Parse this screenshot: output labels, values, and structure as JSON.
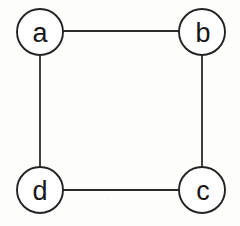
{
  "diagram": {
    "kind": "undirected-graph",
    "title": "",
    "width": 240,
    "height": 226,
    "background_color": "#fdfdfc",
    "stroke_color": "#232323",
    "edge_color": "#2b2b2b",
    "label_color": "#171717",
    "node_fill": "#ffffff",
    "node_radius": 23,
    "edge_stroke_width": 1.8,
    "node_stroke_width": 1.9,
    "nodes": [
      {
        "id": "a",
        "label": "a",
        "cx": 40,
        "cy": 32,
        "r": 23
      },
      {
        "id": "b",
        "label": "b",
        "cx": 202,
        "cy": 32,
        "r": 23
      },
      {
        "id": "c",
        "label": "c",
        "cx": 202,
        "cy": 190,
        "r": 23
      },
      {
        "id": "d",
        "label": "d",
        "cx": 40,
        "cy": 190,
        "r": 23
      }
    ],
    "edges": [
      {
        "id": "a-b",
        "from": "a",
        "to": "b",
        "x1": 63,
        "y1": 31,
        "x2": 179,
        "y2": 31
      },
      {
        "id": "b-c",
        "from": "b",
        "to": "c",
        "x1": 202,
        "y1": 55,
        "x2": 202,
        "y2": 167
      },
      {
        "id": "d-c",
        "from": "d",
        "to": "c",
        "x1": 63,
        "y1": 190,
        "x2": 179,
        "y2": 190
      },
      {
        "id": "a-d",
        "from": "a",
        "to": "d",
        "x1": 40,
        "y1": 55,
        "x2": 40,
        "y2": 167
      }
    ]
  }
}
